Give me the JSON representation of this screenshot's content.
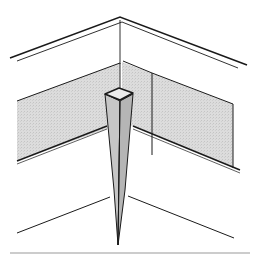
{
  "figure": {
    "title": "",
    "colors": {
      "line": "#1a1a1a",
      "panel_fill": "#d9d9d9",
      "post_fill": "#c8c8c8",
      "post_side": "#b4b4b4",
      "background": "#ffffff",
      "rule": "#9a9a9a"
    },
    "parts": [
      {
        "id": "top-edge",
        "label": ""
      },
      {
        "id": "shaded-boards",
        "label": ""
      },
      {
        "id": "corner-stake",
        "label": ""
      },
      {
        "id": "ground-lines",
        "label": ""
      },
      {
        "id": "bottom-rule",
        "label": ""
      }
    ]
  }
}
